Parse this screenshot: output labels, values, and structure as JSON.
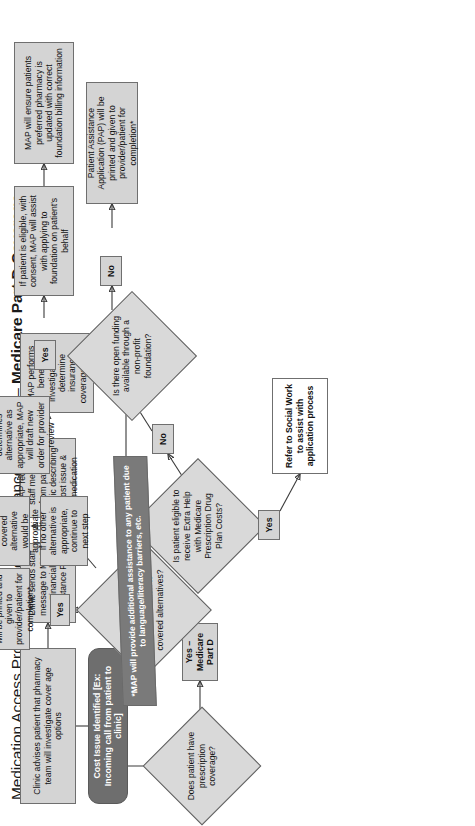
{
  "title": {
    "light": "Medication Access Program Financial Assistance Workflow – ",
    "bold": "Medicare Part D Coverage"
  },
  "colors": {
    "process_fill": "#d4d4d4",
    "process_border": "#6f6f6f",
    "start_fill": "#6e6e6e",
    "note_fill": "#7a7a7a",
    "decision_fill": "#d9d9d9",
    "connector": "#3a3a3a",
    "white_box_fill": "#ffffff"
  },
  "nodes": {
    "start": "Cost Issue Identified [Ex: Incoming call from patient to clinic]",
    "advise": "Clinic advises patient that pharmacy team will investigate cover age options",
    "send_message": "Clinic sends staff message to MAP Financial Assistance Pool",
    "map_receives": "MAP receives staff message from patient's clinic describing cost issue & medication",
    "benefits_investigation": "MAP performs benefits investigation to determine insurance coverage status",
    "pap_printed_top": "Patient Assistance Application (PAP) will be printed and given to provider/patient for completion*",
    "consult_provider": "Consult with provider to determine if a covered alternative would be appropriate",
    "no_alternative": "If no other alternative is appropriate, continue to next step",
    "provider_determines": "If provider determines alternative as appropriate, MAP will draft new order for provider review",
    "patient_eligible_consent": "If patient is eligible, with consent, MAP will assist with applying to foundation on patient's behalf",
    "pharmacy_updated": "MAP will ensure patients preferred pharmacy is updated with correct foundation billing information",
    "pap_printed_bottom": "Patient Assistance Application (PAP) will be printed and given to provider/patient for completion*",
    "refer_social_work": "Refer to Social Work to assist with application process",
    "note": "*MAP will provide additional assistance to any patient due to language/literacy barriers, etc."
  },
  "decisions": {
    "prescription_coverage": "Does patient have prescription coverage?",
    "tried_failed": "Has the patient tried and failed or have a contraindication to covered alternatives?",
    "extra_help": "Is patient eligible to receive Extra Help with Medicare Prescription Drug Plan Costs?",
    "open_funding": "Is there open funding available through a non-profit foundation?"
  },
  "edge_labels": {
    "medicare_part_d": "Yes – Medicare Part D",
    "yes_tried": "Yes",
    "no_tried": "No",
    "yes_extra_help": "Yes",
    "no_extra_help": "No",
    "yes_funding": "Yes",
    "no_funding": "No"
  }
}
